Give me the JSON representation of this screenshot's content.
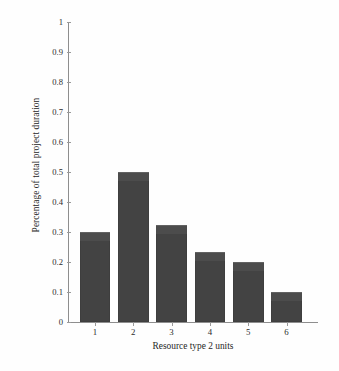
{
  "chart_data": {
    "type": "bar",
    "title": "",
    "xlabel": "Resource type 2 units",
    "ylabel": "Percentage of total project duration",
    "categories": [
      "1",
      "2",
      "3",
      "4",
      "5",
      "6"
    ],
    "values": [
      0.3,
      0.5,
      0.325,
      0.235,
      0.2,
      0.1
    ],
    "ylim": [
      0,
      1
    ],
    "ytick_labels": [
      "0",
      "0.1",
      "0.2",
      "0.3",
      "0.4",
      "0.5",
      "0.6",
      "0.7",
      "0.8",
      "0.9",
      "1"
    ],
    "ytick_values": [
      0,
      0.1,
      0.2,
      0.3,
      0.4,
      0.5,
      0.6,
      0.7,
      0.8,
      0.9,
      1
    ],
    "grid": false,
    "legend": null,
    "bar_color": "#434343",
    "axis_color": "#8e8e8e",
    "background_color": "#ffffff"
  }
}
